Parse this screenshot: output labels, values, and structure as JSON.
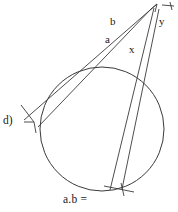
{
  "figure": {
    "kind": "geometry-diagram",
    "background_color": "#ffffff",
    "stroke_color": "#333333",
    "text_color": "#1a1a1a",
    "labels": {
      "b": "b",
      "a": "a",
      "x": "x",
      "y": "y",
      "item": "d)",
      "expression": "a.b ="
    },
    "icons": {
      "apex_arrow": "arrowhead-icon",
      "left_arrow": "arrowhead-icon",
      "bottom_arrow": "arrowhead-icon",
      "apex_tick": "tick-mark-icon"
    },
    "circle": {
      "cx": 102,
      "cy": 129,
      "r": 62
    },
    "apex": {
      "x": 156,
      "y": 6
    },
    "segments": [
      {
        "name": "line-b",
        "x1": 156,
        "y1": 6,
        "x2": 26,
        "y2": 120
      },
      {
        "name": "line-a",
        "x1": 152,
        "y1": 7,
        "x2": 40,
        "y2": 127
      },
      {
        "name": "line-x",
        "x1": 155,
        "y1": 8,
        "x2": 110,
        "y2": 190
      },
      {
        "name": "line-y",
        "x1": 158,
        "y1": 9,
        "x2": 122,
        "y2": 190
      }
    ]
  }
}
